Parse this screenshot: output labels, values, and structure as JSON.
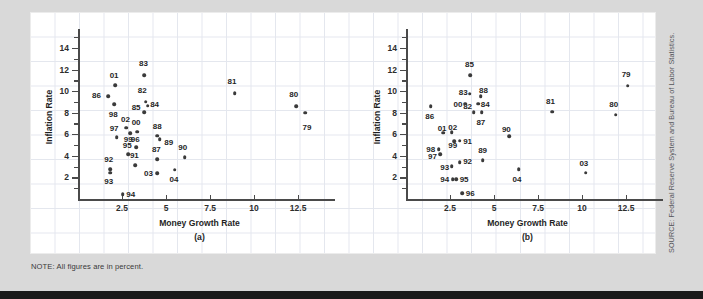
{
  "note": "NOTE: All figures are in percent.",
  "source": "SOURCE: Federal Reserve System and Bureau of Labor Statistics.",
  "chart_data": [
    {
      "type": "scatter",
      "panel": "(a)",
      "title": "",
      "xlabel": "Money Growth Rate",
      "ylabel": "Inflation Rate",
      "xlim": [
        0,
        13.8
      ],
      "ylim": [
        0,
        15.2
      ],
      "xticks": [
        2.5,
        5,
        7.5,
        10,
        12.5
      ],
      "yticks": [
        2,
        4,
        6,
        8,
        10,
        12,
        14
      ],
      "grid": false,
      "legend": "none",
      "points": [
        {
          "label": "79",
          "x": 12.9,
          "y": 8.0,
          "lx": 13.0,
          "ly": 6.7
        },
        {
          "label": "80",
          "x": 12.4,
          "y": 8.6,
          "lx": 12.25,
          "ly": 9.7
        },
        {
          "label": "81",
          "x": 8.9,
          "y": 9.8,
          "lx": 8.75,
          "ly": 10.9
        },
        {
          "label": "82",
          "x": 3.85,
          "y": 9.0,
          "lx": 3.65,
          "ly": 10.1
        },
        {
          "label": "83",
          "x": 3.75,
          "y": 11.5,
          "lx": 3.72,
          "ly": 12.6
        },
        {
          "label": "84",
          "x": 3.95,
          "y": 8.65,
          "lx": 4.35,
          "ly": 8.8
        },
        {
          "label": "85",
          "x": 3.75,
          "y": 8.05,
          "lx": 3.3,
          "ly": 8.55
        },
        {
          "label": "86",
          "x": 1.72,
          "y": 9.55,
          "lx": 1.05,
          "ly": 9.6
        },
        {
          "label": "87",
          "x": 4.5,
          "y": 3.7,
          "lx": 4.45,
          "ly": 4.65
        },
        {
          "label": "88",
          "x": 4.5,
          "y": 5.85,
          "lx": 4.5,
          "ly": 6.75
        },
        {
          "label": "89",
          "x": 4.65,
          "y": 5.55,
          "lx": 5.15,
          "ly": 5.3
        },
        {
          "label": "90",
          "x": 6.05,
          "y": 3.85,
          "lx": 5.95,
          "ly": 4.85
        },
        {
          "label": "91",
          "x": 3.25,
          "y": 3.15,
          "lx": 3.2,
          "ly": 4.1
        },
        {
          "label": "92",
          "x": 1.82,
          "y": 2.75,
          "lx": 1.75,
          "ly": 3.7
        },
        {
          "label": "93",
          "x": 1.82,
          "y": 2.45,
          "lx": 1.75,
          "ly": 1.65
        },
        {
          "label": "94",
          "x": 2.55,
          "y": 0.45,
          "lx": 3.0,
          "ly": 0.45
        },
        {
          "label": "95",
          "x": 2.85,
          "y": 4.15,
          "lx": 2.8,
          "ly": 5.0
        },
        {
          "label": "96",
          "x": 3.3,
          "y": 4.8,
          "lx": 3.25,
          "ly": 5.6
        },
        {
          "label": "97",
          "x": 2.2,
          "y": 5.75,
          "lx": 2.05,
          "ly": 6.6
        },
        {
          "label": "98",
          "x": 2.05,
          "y": 8.8,
          "lx": 2.0,
          "ly": 7.9
        },
        {
          "label": "99",
          "x": 2.95,
          "y": 6.1,
          "lx": 2.85,
          "ly": 5.6
        },
        {
          "label": "00",
          "x": 3.35,
          "y": 6.25,
          "lx": 3.3,
          "ly": 7.15
        },
        {
          "label": "01",
          "x": 2.12,
          "y": 10.55,
          "lx": 2.05,
          "ly": 11.5
        },
        {
          "label": "02",
          "x": 2.75,
          "y": 6.6,
          "lx": 2.7,
          "ly": 7.4
        },
        {
          "label": "03",
          "x": 4.5,
          "y": 2.4,
          "lx": 4.0,
          "ly": 2.45
        },
        {
          "label": "04",
          "x": 5.5,
          "y": 2.7,
          "lx": 5.45,
          "ly": 1.85
        }
      ]
    },
    {
      "type": "scatter",
      "panel": "(b)",
      "title": "",
      "xlabel": "Money Growth Rate",
      "ylabel": "Inflation Rate",
      "xlim": [
        0,
        13.8
      ],
      "ylim": [
        0,
        15.2
      ],
      "xticks": [
        2.5,
        5,
        7.5,
        10,
        12.5
      ],
      "yticks": [
        2,
        4,
        6,
        8,
        10,
        12,
        14
      ],
      "grid": false,
      "legend": "none",
      "points": [
        {
          "label": "79",
          "x": 12.6,
          "y": 10.5,
          "lx": 12.5,
          "ly": 11.55
        },
        {
          "label": "80",
          "x": 11.9,
          "y": 7.8,
          "lx": 11.8,
          "ly": 8.8
        },
        {
          "label": "81",
          "x": 8.3,
          "y": 8.1,
          "lx": 8.2,
          "ly": 9.1
        },
        {
          "label": "82",
          "x": 3.85,
          "y": 8.05,
          "lx": 3.5,
          "ly": 8.6
        },
        {
          "label": "83",
          "x": 3.62,
          "y": 9.75,
          "lx": 3.25,
          "ly": 9.95
        },
        {
          "label": "84",
          "x": 4.1,
          "y": 8.85,
          "lx": 4.5,
          "ly": 8.8
        },
        {
          "label": "85",
          "x": 3.65,
          "y": 11.5,
          "lx": 3.6,
          "ly": 12.5
        },
        {
          "label": "86",
          "x": 1.4,
          "y": 8.6,
          "lx": 1.35,
          "ly": 7.7
        },
        {
          "label": "87",
          "x": 4.3,
          "y": 8.05,
          "lx": 4.25,
          "ly": 7.15
        },
        {
          "label": "88",
          "x": 4.25,
          "y": 9.55,
          "lx": 4.4,
          "ly": 10.1
        },
        {
          "label": "89",
          "x": 4.35,
          "y": 3.6,
          "lx": 4.35,
          "ly": 4.5
        },
        {
          "label": "90",
          "x": 5.85,
          "y": 5.8,
          "lx": 5.7,
          "ly": 6.5
        },
        {
          "label": "91",
          "x": 3.05,
          "y": 5.4,
          "lx": 3.5,
          "ly": 5.4
        },
        {
          "label": "92",
          "x": 3.05,
          "y": 3.4,
          "lx": 3.5,
          "ly": 3.5
        },
        {
          "label": "93",
          "x": 2.6,
          "y": 3.05,
          "lx": 2.2,
          "ly": 2.95
        },
        {
          "label": "94",
          "x": 2.65,
          "y": 1.85,
          "lx": 2.2,
          "ly": 1.85
        },
        {
          "label": "95",
          "x": 2.85,
          "y": 1.85,
          "lx": 3.3,
          "ly": 1.85
        },
        {
          "label": "96",
          "x": 3.2,
          "y": 0.55,
          "lx": 3.65,
          "ly": 0.6
        },
        {
          "label": "97",
          "x": 1.95,
          "y": 4.15,
          "lx": 1.5,
          "ly": 3.95
        },
        {
          "label": "98",
          "x": 1.85,
          "y": 4.6,
          "lx": 1.4,
          "ly": 4.6
        },
        {
          "label": "99",
          "x": 2.75,
          "y": 5.35,
          "lx": 2.65,
          "ly": 5.05
        },
        {
          "label": "00",
          "x": 3.35,
          "y": 8.85,
          "lx": 2.95,
          "ly": 8.85
        },
        {
          "label": "01",
          "x": 2.1,
          "y": 6.15,
          "lx": 2.05,
          "ly": 6.6
        },
        {
          "label": "02",
          "x": 2.6,
          "y": 6.2,
          "lx": 2.65,
          "ly": 6.65
        },
        {
          "label": "03",
          "x": 10.2,
          "y": 2.45,
          "lx": 10.1,
          "ly": 3.35
        },
        {
          "label": "04",
          "x": 6.4,
          "y": 2.75,
          "lx": 6.3,
          "ly": 1.85
        }
      ]
    }
  ]
}
